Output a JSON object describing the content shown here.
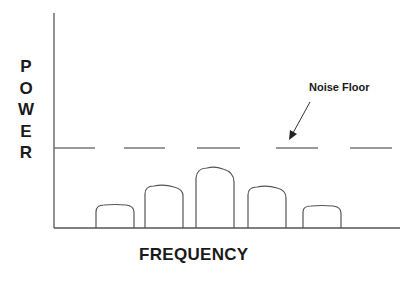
{
  "diagram": {
    "type": "spectrum-diagram",
    "y_axis_label": "POWER",
    "y_axis_letters": [
      "P",
      "O",
      "W",
      "E",
      "R"
    ],
    "x_axis_label": "FREQUENCY",
    "annotation": {
      "label": "Noise Floor",
      "points_to": "noise-floor-line"
    },
    "noise_floor": {
      "style": "dashed",
      "relative_level": 0.37
    },
    "signals": [
      {
        "name": "signal-1",
        "relative_height": 0.11
      },
      {
        "name": "signal-2",
        "relative_height": 0.2
      },
      {
        "name": "signal-3",
        "relative_height": 0.29
      },
      {
        "name": "signal-4",
        "relative_height": 0.2
      },
      {
        "name": "signal-5",
        "relative_height": 0.11
      }
    ],
    "colors": {
      "line": "#555555",
      "text": "#1a1a1a",
      "background": "#ffffff"
    }
  }
}
